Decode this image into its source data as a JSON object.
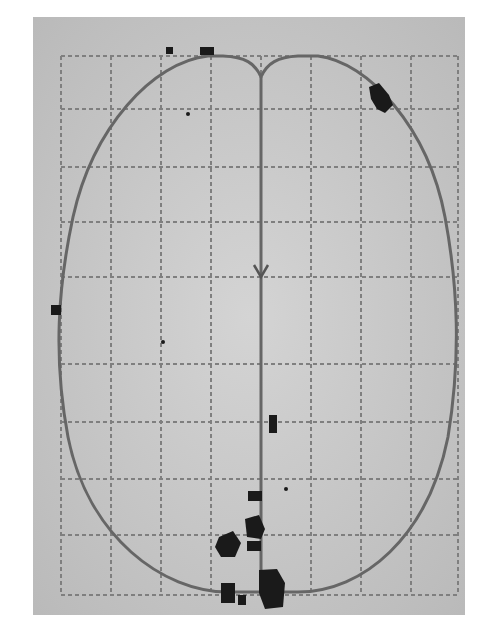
{
  "figure": {
    "background": "#c9c9c9",
    "grid_color": "#7a7a7a",
    "outline_color": "#6a6a6a",
    "mark_color": "#1a1a1a"
  }
}
